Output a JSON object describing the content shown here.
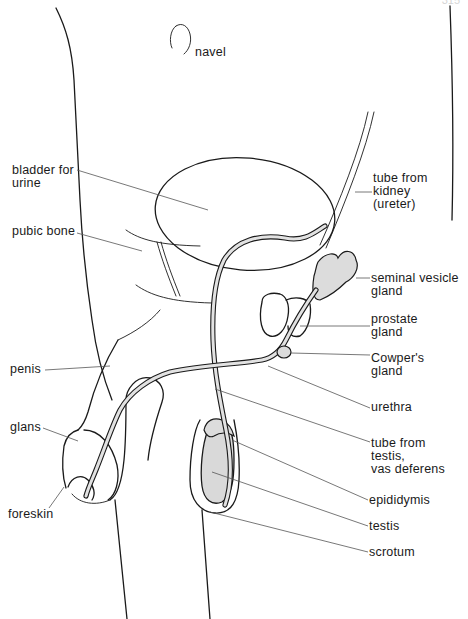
{
  "page": {
    "number": "315"
  },
  "colors": {
    "line": "#1a1a1a",
    "leader": "#555555",
    "tissue_fill": "#d9d9d9",
    "background": "#ffffff"
  },
  "labels": {
    "navel": "navel",
    "bladder": "bladder for\nurine",
    "pubic_bone": "pubic bone",
    "penis": "penis",
    "glans": "glans",
    "foreskin": "foreskin",
    "ureter": "tube from\nkidney\n(ureter)",
    "seminal_vesicle": "seminal vesicle\ngland",
    "prostate": "prostate\ngland",
    "cowpers": "Cowper's\ngland",
    "urethra": "urethra",
    "vas_deferens": "tube from\ntestis,\nvas deferens",
    "epididymis": "epididymis",
    "testis": "testis",
    "scrotum": "scrotum"
  }
}
